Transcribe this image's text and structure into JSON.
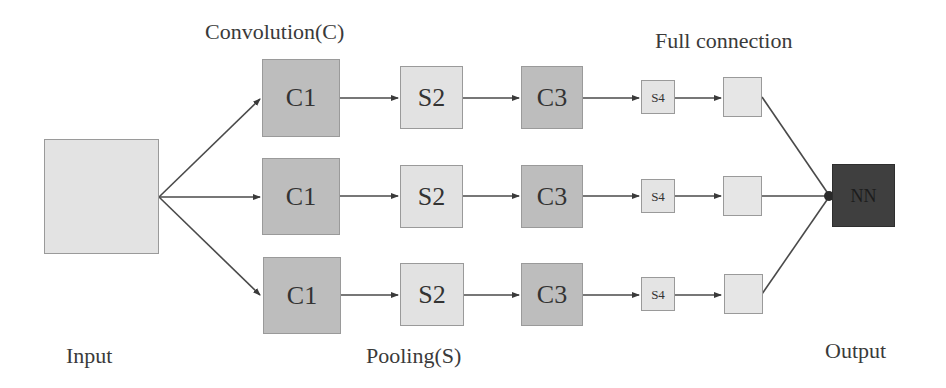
{
  "labels": {
    "convolution": "Convolution(C)",
    "full_connection": "Full connection",
    "input": "Input",
    "pooling": "Pooling(S)",
    "output": "Output"
  },
  "rows": [
    {
      "c1": "C1",
      "s2": "S2",
      "c3": "C3",
      "s4": "S4",
      "fc": ""
    },
    {
      "c1": "C1",
      "s2": "S2",
      "c3": "C3",
      "s4": "S4",
      "fc": ""
    },
    {
      "c1": "C1",
      "s2": "S2",
      "c3": "C3",
      "s4": "S4",
      "fc": ""
    }
  ],
  "output_node": "NN",
  "colors": {
    "conv_fill": "#bdbdbd",
    "pool_fill": "#e2e2e2",
    "input_fill": "#e3e3e3",
    "output_fill": "#3f3f3f",
    "edge": "#444444"
  }
}
